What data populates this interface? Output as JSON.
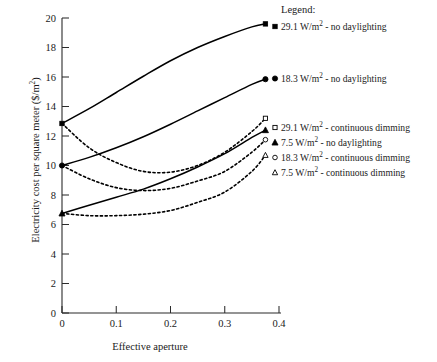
{
  "chart_data": {
    "type": "line",
    "title": "",
    "xlabel": "Effective aperture",
    "ylabel": "Electricity cost per square meter ($/m²)",
    "xlim": [
      0,
      0.4
    ],
    "ylim": [
      0,
      20
    ],
    "xticks": [
      "0",
      "0.1",
      "0.2",
      "0.3",
      "0.4"
    ],
    "xtick_values": [
      0,
      0.1,
      0.2,
      0.3,
      0.4
    ],
    "yticks": [
      "0",
      "2",
      "4",
      "6",
      "8",
      "10",
      "12",
      "14",
      "16",
      "18",
      "20"
    ],
    "ytick_values": [
      0,
      2,
      4,
      6,
      8,
      10,
      12,
      14,
      16,
      18,
      20
    ],
    "grid": false,
    "legend_position": "right",
    "legend_title": "Legend:",
    "x": [
      0,
      0.05,
      0.1,
      0.15,
      0.2,
      0.25,
      0.3,
      0.35,
      0.375
    ],
    "series": [
      {
        "name": "29.1 W/m² - no daylighting",
        "power": "29.1",
        "mode": "no daylighting",
        "marker": "filled-square",
        "line": "solid",
        "color": "#000000",
        "values": [
          12.85,
          13.85,
          14.95,
          16.05,
          17.1,
          18.0,
          18.75,
          19.4,
          19.6
        ]
      },
      {
        "name": "18.3 W/m² - no daylighting",
        "power": "18.3",
        "mode": "no daylighting",
        "marker": "filled-circle",
        "line": "solid",
        "color": "#000000",
        "values": [
          10.0,
          10.55,
          11.2,
          11.95,
          12.8,
          13.7,
          14.6,
          15.5,
          15.85
        ]
      },
      {
        "name": "29.1 W/m² - continuous dimming",
        "power": "29.1",
        "mode": "continuous dimming",
        "marker": "open-square",
        "line": "dotted",
        "color": "#000000",
        "values": [
          12.85,
          11.2,
          10.2,
          9.6,
          9.55,
          10.0,
          10.9,
          12.3,
          13.2
        ]
      },
      {
        "name": "7.5 W/m² - no daylighting",
        "power": "7.5",
        "mode": "no daylighting",
        "marker": "filled-triangle",
        "line": "solid",
        "color": "#000000",
        "values": [
          6.75,
          7.3,
          7.85,
          8.4,
          9.1,
          9.9,
          10.8,
          11.9,
          12.4
        ]
      },
      {
        "name": "18.3 W/m² - continuous dimming",
        "power": "18.3",
        "mode": "continuous dimming",
        "marker": "open-circle",
        "line": "dotted",
        "color": "#000000",
        "values": [
          10.0,
          9.1,
          8.5,
          8.3,
          8.45,
          8.95,
          9.6,
          10.9,
          11.75
        ]
      },
      {
        "name": "7.5 W/m² - continuous dimming",
        "power": "7.5",
        "mode": "continuous dimming",
        "marker": "open-triangle",
        "line": "dotted",
        "color": "#000000",
        "values": [
          6.75,
          6.6,
          6.6,
          6.7,
          6.95,
          7.5,
          8.2,
          9.6,
          10.7
        ]
      }
    ]
  },
  "legend": {
    "title": "Legend:",
    "entries": [
      {
        "label_prefix": "29.1 W/m",
        "sup": "2",
        "label_suffix": " - no daylighting",
        "full": "29.1 W/m2 - no daylighting",
        "marker": "filled-square"
      },
      {
        "label_prefix": "18.3 W/m",
        "sup": "2",
        "label_suffix": " - no daylighting",
        "full": "18.3 W/m2 - no daylighting",
        "marker": "filled-circle"
      },
      {
        "label_prefix": "29.1 W/m",
        "sup": "2",
        "label_suffix": " - continuous dimming",
        "full": "29.1 W/m2 - continuous dimming",
        "marker": "open-square"
      },
      {
        "label_prefix": "7.5 W/m",
        "sup": "2",
        "label_suffix": " - no daylighting",
        "full": "7.5 W/m2 - no daylighting",
        "marker": "filled-triangle"
      },
      {
        "label_prefix": "18.3 W/m",
        "sup": "2",
        "label_suffix": " - continuous dimming",
        "full": "18.3 W/m2 - continuous dimming",
        "marker": "open-circle"
      },
      {
        "label_prefix": "7.5 W/m",
        "sup": "2",
        "label_suffix": " - continuous dimming",
        "full": "7.5 W/m2 - continuous dimming",
        "marker": "open-triangle"
      }
    ]
  },
  "axes": {
    "xlabel": "Effective aperture",
    "ylabel_prefix": "Electricity cost per square meter ($/m",
    "ylabel_sup": "2",
    "ylabel_suffix": ")"
  }
}
